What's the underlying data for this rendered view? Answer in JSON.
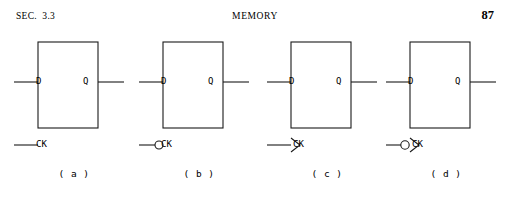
{
  "header": {
    "section_label": "SEC.  3.3",
    "running_title": "MEMORY",
    "page_number": "87"
  },
  "figure": {
    "flipflops": [
      {
        "caption": "( a )",
        "data_label": "D",
        "output_label": "Q",
        "clock_label": "CK",
        "clock_inverted": false,
        "clock_edge_triggered": false
      },
      {
        "caption": "( b )",
        "data_label": "D",
        "output_label": "Q",
        "clock_label": "CK",
        "clock_inverted": true,
        "clock_edge_triggered": false
      },
      {
        "caption": "( c )",
        "data_label": "D",
        "output_label": "Q",
        "clock_label": "CK",
        "clock_inverted": false,
        "clock_edge_triggered": true
      },
      {
        "caption": "( d )",
        "data_label": "D",
        "output_label": "Q",
        "clock_label": "CK",
        "clock_inverted": true,
        "clock_edge_triggered": true
      }
    ],
    "line_color": "#1a1a1a"
  }
}
